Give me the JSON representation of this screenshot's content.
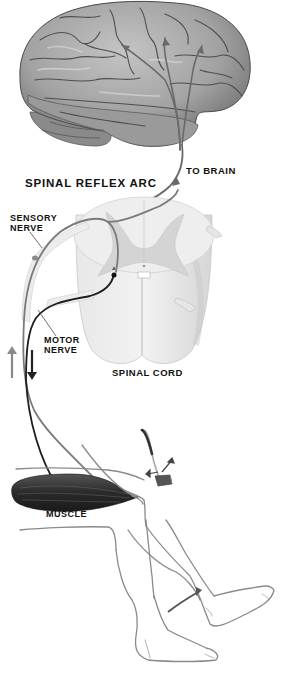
{
  "diagram": {
    "title": "SPINAL REFLEX ARC",
    "labels": {
      "to_brain": "TO BRAIN",
      "sensory_nerve_line1": "SENSORY",
      "sensory_nerve_line2": "NERVE",
      "motor_nerve_line1": "MOTOR",
      "motor_nerve_line2": "NERVE",
      "spinal_cord": "SPINAL CORD",
      "muscle": "MUSCLE"
    },
    "components": [
      {
        "id": "brain",
        "description": "Lateral view of cerebrum with three ascending arrows"
      },
      {
        "id": "spinal-cord",
        "description": "Cross-section of spinal cord showing grey matter butterfly"
      },
      {
        "id": "sensory-nerve",
        "description": "Grey pathway from knee to spinal cord, branching up to brain"
      },
      {
        "id": "motor-nerve",
        "description": "Dark pathway from spinal cord down to thigh muscle"
      },
      {
        "id": "muscle",
        "description": "Dark quadriceps muscle in thigh"
      },
      {
        "id": "reflex-hammer",
        "description": "Hammer striking patellar tendon below knee"
      },
      {
        "id": "legs",
        "description": "Line drawing of seated legs, one kicking forward"
      }
    ],
    "arrows": {
      "sensory_direction": "up",
      "motor_direction": "down",
      "leg_kick": "forward-up"
    },
    "colors": {
      "brain_fill": "#a8a8a8",
      "brain_shadow": "#6e6e6e",
      "cord_white_matter": "#e6e6e6",
      "cord_grey_matter": "#d2d2d2",
      "sensory_nerve": "#7a7a7a",
      "motor_nerve": "#222222",
      "muscle": "#2e2e2e",
      "leg_outline": "#8a8a8a",
      "text": "#111111"
    }
  }
}
